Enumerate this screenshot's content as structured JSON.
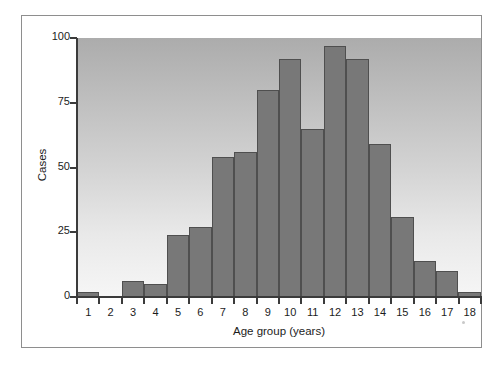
{
  "figure": {
    "background_color": "#ffffff",
    "frame_color": "#8e8e8e",
    "bar_color": "#787878",
    "bar_edge_color": "#4f4f4f",
    "axis_color": "#3b3b3b",
    "panel_top_color": "#acacac",
    "panel_bottom_color": "#f6f6f6"
  },
  "chart_data": {
    "type": "bar",
    "title": "",
    "subtitle": "",
    "xlabel": "Age group (years)",
    "ylabel": "Cases",
    "categories": [
      "1",
      "2",
      "3",
      "4",
      "5",
      "6",
      "7",
      "8",
      "9",
      "10",
      "11",
      "12",
      "13",
      "14",
      "15",
      "16",
      "17",
      "18"
    ],
    "values": [
      2,
      0,
      6,
      5,
      24,
      27,
      54,
      56,
      80,
      92,
      65,
      97,
      92,
      59,
      31,
      14,
      10,
      2
    ],
    "ylim": [
      0,
      100
    ],
    "xlim": [
      0.5,
      18.5
    ],
    "ytick_labels": [
      "0",
      "25",
      "50",
      "75",
      "100"
    ],
    "ytick_values": [
      0,
      25,
      50,
      75,
      100
    ],
    "xtick_labels": [
      "1",
      "2",
      "3",
      "4",
      "5",
      "6",
      "7",
      "8",
      "9",
      "10",
      "11",
      "12",
      "13",
      "14",
      "15",
      "16",
      "17",
      "18"
    ],
    "grid": false,
    "legend": false,
    "legend_position": "none",
    "annotations": []
  }
}
